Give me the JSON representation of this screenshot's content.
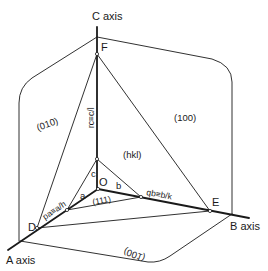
{
  "diagram": {
    "colors": {
      "line": "#1a1a1a",
      "background": "#ffffff"
    },
    "axes": {
      "c": "C axis",
      "b": "B axis",
      "a": "A axis"
    },
    "points": {
      "F": "F",
      "O": "O",
      "D": "D",
      "E": "E"
    },
    "segments": {
      "a": "a",
      "b": "b",
      "c": "c"
    },
    "intercepts": {
      "pa": "pa≡a/h",
      "qb": "qb≡b/k",
      "rc": "rc≡c/l"
    },
    "faces": {
      "f010": "(010)",
      "f100": "(100)",
      "f001": "(001)",
      "fhkl": "(hkl)",
      "f111": "(111)"
    }
  }
}
